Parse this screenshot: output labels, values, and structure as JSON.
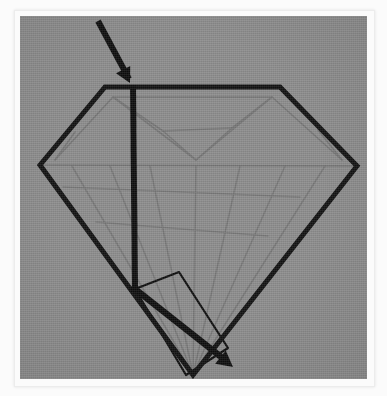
{
  "figure": {
    "title": "Light ray path through a brilliant-cut diamond",
    "caption": "",
    "background_color": "#8a8a8a",
    "frame_color": "#fbfbfb",
    "stroke_color": "#111111",
    "facet_color": "#6e6e6e",
    "canvas": {
      "x": 20,
      "y": 16,
      "width": 347,
      "height": 363
    }
  },
  "diamond": {
    "name": "brilliant-cut-diamond",
    "outline_label": "diamond outline",
    "stroke_width": 5,
    "table_left": {
      "x": 105,
      "y": 87
    },
    "table_right": {
      "x": 280,
      "y": 87
    },
    "girdle_left": {
      "x": 40,
      "y": 165
    },
    "girdle_right": {
      "x": 357,
      "y": 166
    },
    "culet": {
      "x": 193,
      "y": 375
    },
    "outline_points": "105,87 280,87 357,166 193,375 40,165"
  },
  "facets": {
    "label": "internal facet lines",
    "stroke_width": 1.6,
    "crown_lines": [
      "40,165 105,87",
      "280,87 357,166",
      "40,165 357,166",
      "113,97 272,97",
      "113,97 55,160",
      "272,97 342,160",
      "113,97 196,160",
      "272,97 196,160",
      "113,97 160,130",
      "272,97 232,128",
      "160,130 196,160",
      "232,128 196,160",
      "160,130 232,128",
      "55,160 113,97",
      "342,160 272,97"
    ],
    "pavilion_lines": [
      "40,165 193,375",
      "357,166 193,375",
      "72,165 193,375",
      "110,165 193,375",
      "150,165 193,375",
      "196,165 193,375",
      "240,165 193,375",
      "285,165 193,375",
      "325,165 193,375",
      "96,200 255,228",
      "63,186 300,196"
    ]
  },
  "light_path": {
    "label": "light ray path",
    "stroke_width": 6,
    "incident_ray": {
      "name": "incident-ray",
      "from": {
        "x": 98,
        "y": 21
      },
      "to": {
        "x": 130,
        "y": 83
      },
      "arrow_at": {
        "x": 130,
        "y": 83
      },
      "description": "incoming light ray striking the table"
    },
    "refracted_ray": {
      "name": "refracted-ray",
      "from": {
        "x": 133,
        "y": 85
      },
      "to": {
        "x": 135,
        "y": 289
      },
      "description": "ray travelling down through the stone to the pavilion facet"
    },
    "reflected_ray": {
      "name": "reflected-ray",
      "from": {
        "x": 135,
        "y": 289
      },
      "to": {
        "x": 233,
        "y": 367
      },
      "arrow_at": {
        "x": 233,
        "y": 367
      },
      "description": "totally internally reflected ray exiting at lower right"
    },
    "reflection_point": {
      "x": 135,
      "y": 289,
      "label": "total internal reflection point"
    }
  },
  "highlight_facet": {
    "name": "highlighted-pavilion-facet",
    "label": "highlighted pavilion facet",
    "stroke_width": 2.2,
    "points": "135,289 179,272 228,348 186,375"
  }
}
